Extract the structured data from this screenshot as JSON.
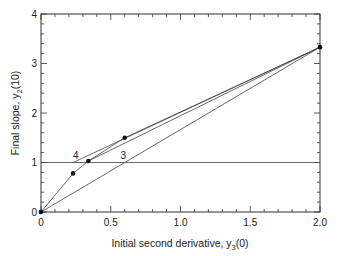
{
  "chart_data": {
    "type": "line",
    "title": "",
    "xlabel": "Initial second derivative, y3(0)",
    "xlabel_main": "Initial second derivative, y",
    "xlabel_sub": "3",
    "xlabel_tail": "(0)",
    "ylabel": "Final slope, y2(10)",
    "ylabel_main": "Final slope, y",
    "ylabel_sub": "2",
    "ylabel_tail": "(10)",
    "xlim": [
      0,
      2.0
    ],
    "ylim": [
      0,
      4
    ],
    "xticks": [
      "0",
      "0.5",
      "1.0",
      "1.5",
      "2.0"
    ],
    "xtick_values": [
      0,
      0.5,
      1.0,
      1.5,
      2.0
    ],
    "yticks": [
      "0",
      "1",
      "2",
      "3",
      "4"
    ],
    "ytick_values": [
      0,
      1,
      2,
      3,
      4
    ],
    "grid": false,
    "series": [
      {
        "name": "curve",
        "x": [
          0,
          0.23,
          0.34,
          0.6,
          2.0
        ],
        "y": [
          0,
          0.78,
          1.03,
          1.5,
          3.33
        ]
      },
      {
        "name": "target",
        "x": [
          0,
          2.0
        ],
        "y": [
          1,
          1
        ]
      },
      {
        "name": "secant 3",
        "x": [
          0,
          2.0
        ],
        "y": [
          0,
          3.33
        ]
      },
      {
        "name": "secant 4",
        "x": [
          0.23,
          2.0
        ],
        "y": [
          1.0,
          3.33
        ]
      },
      {
        "name": "secant 5",
        "x": [
          0.34,
          2.0
        ],
        "y": [
          1.03,
          3.33
        ]
      }
    ],
    "points": [
      {
        "x": 0,
        "y": 0
      },
      {
        "x": 0.23,
        "y": 0.78
      },
      {
        "x": 0.34,
        "y": 1.03
      },
      {
        "x": 0.6,
        "y": 1.5
      },
      {
        "x": 2.0,
        "y": 3.33
      }
    ],
    "annotations": [
      {
        "text": "4",
        "x": 0.25,
        "y": 1.08
      },
      {
        "text": "3",
        "x": 0.59,
        "y": 1.08
      }
    ]
  }
}
